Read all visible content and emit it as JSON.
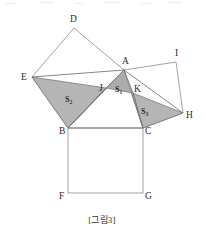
{
  "figure": {
    "caption": "[그림3]",
    "type": "euclidean-geometry-diagram",
    "canvas": {
      "width": 204,
      "height": 237
    },
    "stroke_color": "#8a8a8a",
    "shade_color": "#a8a8a8",
    "label_color": "#2b2b2b",
    "vertices": [
      {
        "id": "A",
        "label": "A",
        "x": 124,
        "y": 70,
        "label_x": 122,
        "label_y": 64
      },
      {
        "id": "B",
        "label": "B",
        "x": 68,
        "y": 128,
        "label_x": 59,
        "label_y": 134
      },
      {
        "id": "C",
        "label": "C",
        "x": 143,
        "y": 128,
        "label_x": 145,
        "label_y": 134
      },
      {
        "id": "D",
        "label": "D",
        "x": 74,
        "y": 28,
        "label_x": 70,
        "label_y": 22
      },
      {
        "id": "E",
        "label": "E",
        "x": 32,
        "y": 77,
        "label_x": 21,
        "label_y": 80
      },
      {
        "id": "F",
        "label": "F",
        "x": 68,
        "y": 193,
        "label_x": 59,
        "label_y": 199
      },
      {
        "id": "G",
        "label": "G",
        "x": 143,
        "y": 193,
        "label_x": 145,
        "label_y": 199
      },
      {
        "id": "H",
        "label": "H",
        "x": 183,
        "y": 113,
        "label_x": 186,
        "label_y": 118
      },
      {
        "id": "I",
        "label": "I",
        "x": 176,
        "y": 62,
        "label_x": 175,
        "label_y": 56
      },
      {
        "id": "J",
        "label": "J",
        "x": 106,
        "y": 88,
        "label_x": 100,
        "label_y": 91
      },
      {
        "id": "K",
        "label": "K",
        "x": 133,
        "y": 93,
        "label_x": 134,
        "label_y": 92
      }
    ],
    "squares": [
      {
        "name": "square-on-AB",
        "vertices": [
          "E",
          "D",
          "A",
          "B"
        ]
      },
      {
        "name": "square-on-BC",
        "vertices": [
          "B",
          "C",
          "G",
          "F"
        ]
      },
      {
        "name": "square-on-AC",
        "vertices": [
          "A",
          "I",
          "H",
          "C"
        ]
      }
    ],
    "shaded_regions": [
      {
        "id": "S1",
        "label": "S",
        "sub": "1",
        "vertices": [
          "J",
          "A",
          "K"
        ],
        "label_x": 116,
        "label_y": 92
      },
      {
        "id": "S2",
        "label": "S",
        "sub": "2",
        "vertices": [
          "E",
          "J",
          "B"
        ],
        "label_x": 66,
        "label_y": 102
      },
      {
        "id": "S3",
        "label": "S",
        "sub": "3",
        "vertices": [
          "K",
          "H",
          "C"
        ],
        "label_x": 142,
        "label_y": 114
      }
    ],
    "extra_segments": [
      {
        "name": "segment-A-J-E",
        "from": "A",
        "to": "E"
      },
      {
        "name": "segment-A-K-H",
        "from": "A",
        "to": "H"
      },
      {
        "name": "segment-B-J",
        "from": "B",
        "to": "J"
      },
      {
        "name": "segment-C-K",
        "from": "C",
        "to": "K"
      }
    ]
  }
}
